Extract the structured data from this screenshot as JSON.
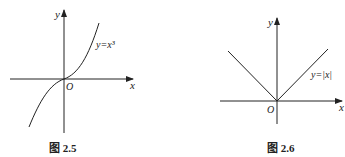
{
  "figures": [
    {
      "id": "fig-2-5",
      "caption": "图 2.5",
      "function_label": "y=x³",
      "axis_x_label": "x",
      "axis_y_label": "y",
      "origin_label": "O"
    },
    {
      "id": "fig-2-6",
      "caption": "图 2.6",
      "function_label": "y=|x|",
      "axis_x_label": "x",
      "axis_y_label": "y",
      "origin_label": "O"
    }
  ]
}
